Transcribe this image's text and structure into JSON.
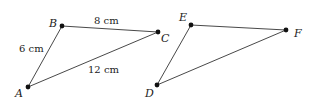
{
  "diagram": {
    "type": "geometry-triangles",
    "triangles": [
      {
        "name": "ABC",
        "vertices": [
          {
            "label": "A",
            "x": 28,
            "y": 87
          },
          {
            "label": "B",
            "x": 62,
            "y": 26
          },
          {
            "label": "C",
            "x": 158,
            "y": 32
          }
        ],
        "sides": [
          {
            "from": "A",
            "to": "B",
            "length": "6 cm"
          },
          {
            "from": "B",
            "to": "C",
            "length": "8 cm"
          },
          {
            "from": "A",
            "to": "C",
            "length": "12 cm"
          }
        ]
      },
      {
        "name": "DEF",
        "vertices": [
          {
            "label": "D",
            "x": 157,
            "y": 85
          },
          {
            "label": "E",
            "x": 191,
            "y": 25
          },
          {
            "label": "F",
            "x": 286,
            "y": 30
          }
        ],
        "sides": [
          {
            "from": "D",
            "to": "E",
            "length": ""
          },
          {
            "from": "E",
            "to": "F",
            "length": ""
          },
          {
            "from": "D",
            "to": "F",
            "length": ""
          }
        ]
      }
    ],
    "labels": {
      "A": "A",
      "B": "B",
      "C": "C",
      "D": "D",
      "E": "E",
      "F": "F",
      "ab": "6 cm",
      "bc": "8 cm",
      "ac": "12 cm"
    }
  }
}
